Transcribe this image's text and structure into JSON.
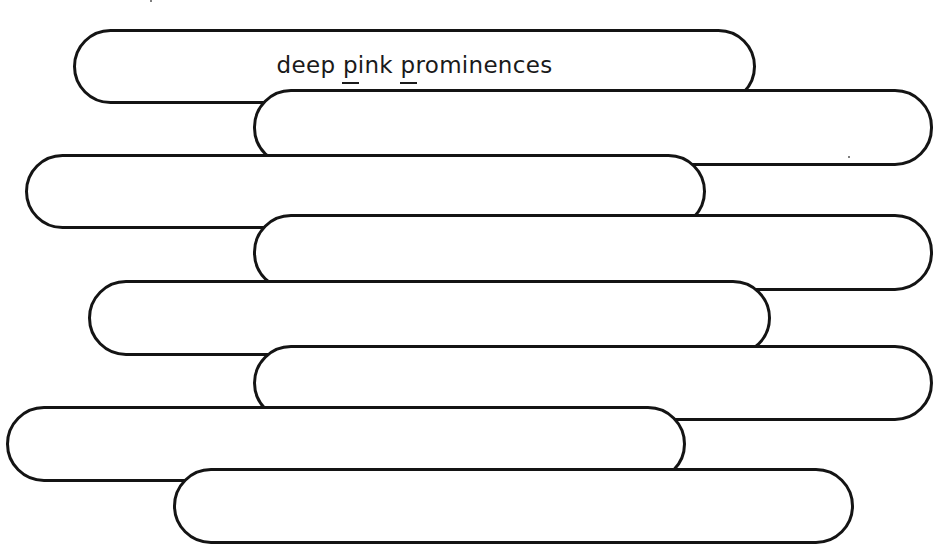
{
  "worksheet": {
    "title_text": {
      "before": "deep ",
      "underlined_1": "p",
      "middle": "ink ",
      "underlined_2": "p",
      "after": "rominences"
    },
    "full_text": "deep pink prominences",
    "pill_count": 8,
    "pills": [
      {
        "index": 1,
        "label": "deep pink prominences"
      },
      {
        "index": 2,
        "label": ""
      },
      {
        "index": 3,
        "label": ""
      },
      {
        "index": 4,
        "label": ""
      },
      {
        "index": 5,
        "label": ""
      },
      {
        "index": 6,
        "label": ""
      },
      {
        "index": 7,
        "label": ""
      },
      {
        "index": 8,
        "label": ""
      }
    ]
  },
  "colors": {
    "background": "#ffffff",
    "outline": "#141414",
    "text": "#1a1a1a"
  }
}
